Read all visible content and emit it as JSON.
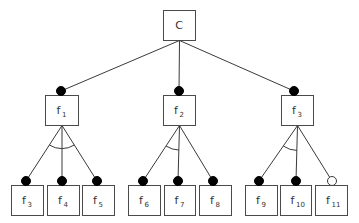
{
  "diagram": {
    "type": "feature-model",
    "root": {
      "id": "C",
      "label": "C",
      "sub": "",
      "x": 163,
      "y": 10,
      "w": 32,
      "h": 30
    },
    "level1": [
      {
        "id": "f1",
        "label": "f",
        "sub": "1",
        "x": 45,
        "y": 95,
        "w": 33,
        "h": 30,
        "connector": "mandatory",
        "dot": [
          61,
          91
        ]
      },
      {
        "id": "f2",
        "label": "f",
        "sub": "2",
        "x": 163,
        "y": 95,
        "w": 32,
        "h": 30,
        "connector": "mandatory",
        "dot": [
          179,
          91
        ]
      },
      {
        "id": "f3",
        "label": "f",
        "sub": "3",
        "x": 281,
        "y": 95,
        "w": 32,
        "h": 30,
        "connector": "mandatory",
        "dot": [
          294,
          91
        ]
      }
    ],
    "groups": [
      {
        "parent": "f1",
        "arc": {
          "type": "full",
          "y": 145
        },
        "children": [
          {
            "id": "f3",
            "label": "f",
            "sub": "3",
            "x": 11,
            "y": 185,
            "w": 32,
            "h": 30,
            "connector": "mandatory",
            "dot": [
              26,
              181
            ]
          },
          {
            "id": "f4",
            "label": "f",
            "sub": "4",
            "x": 47,
            "y": 185,
            "w": 32,
            "h": 30,
            "connector": "mandatory",
            "dot": [
              62,
              181
            ]
          },
          {
            "id": "f5",
            "label": "f",
            "sub": "5",
            "x": 82,
            "y": 185,
            "w": 32,
            "h": 30,
            "connector": "mandatory",
            "dot": [
              97,
              181
            ]
          }
        ]
      },
      {
        "parent": "f2",
        "arc": {
          "type": "left-half",
          "y": 146
        },
        "children": [
          {
            "id": "f6",
            "label": "f",
            "sub": "6",
            "x": 128,
            "y": 185,
            "w": 32,
            "h": 30,
            "connector": "mandatory",
            "dot": [
              143,
              181
            ]
          },
          {
            "id": "f7",
            "label": "f",
            "sub": "7",
            "x": 164,
            "y": 185,
            "w": 31,
            "h": 30,
            "connector": "mandatory",
            "dot": [
              178,
              181
            ]
          },
          {
            "id": "f8",
            "label": "f",
            "sub": "8",
            "x": 199,
            "y": 185,
            "w": 32,
            "h": 30,
            "connector": "mandatory",
            "dot": [
              213,
              181
            ]
          }
        ]
      },
      {
        "parent": "f3",
        "arc": {
          "type": "left-half",
          "y": 146
        },
        "children": [
          {
            "id": "f9",
            "label": "f",
            "sub": "9",
            "x": 245,
            "y": 185,
            "w": 32,
            "h": 30,
            "connector": "mandatory",
            "dot": [
              259,
              181
            ]
          },
          {
            "id": "f10",
            "label": "f",
            "sub": "10",
            "x": 280,
            "y": 185,
            "w": 31,
            "h": 30,
            "connector": "mandatory",
            "dot": [
              296,
              181
            ]
          },
          {
            "id": "f11",
            "label": "f",
            "sub": "11",
            "x": 315,
            "y": 185,
            "w": 32,
            "h": 30,
            "connector": "optional",
            "dot": [
              332,
              181
            ]
          }
        ]
      }
    ],
    "colors": {
      "stroke": "#3a3a3a",
      "box": "#4a4a4a",
      "text": "#333333",
      "filled_dot": "#000000",
      "hollow_dot": "#ffffff"
    }
  }
}
